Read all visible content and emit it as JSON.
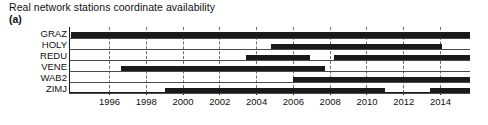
{
  "figure": {
    "title": "Real network stations coordinate availability",
    "panel_label": "(a)"
  },
  "chart_data": {
    "type": "bar",
    "title": "Real network stations coordinate availability",
    "subtitle": "(a)",
    "xlabel": "",
    "ylabel": "",
    "orientation": "horizontal",
    "grid": true,
    "grid_axis": "x",
    "legend": "none",
    "xlim": [
      1993.8,
      2015.6
    ],
    "xticks": [
      1996,
      1998,
      2000,
      2002,
      2004,
      2006,
      2008,
      2010,
      2012,
      2014
    ],
    "xtick_labels": [
      "1996",
      "1998",
      "2000",
      "2002",
      "2004",
      "2006",
      "2008",
      "2010",
      "2012",
      "2014"
    ],
    "categories": [
      "GRAZ",
      "HOLY",
      "REDU",
      "VENE",
      "WAB2",
      "ZIMJ"
    ],
    "bar_color": "#1a1a1a",
    "series": [
      {
        "name": "GRAZ",
        "label": "GRAZ",
        "intervals": [
          {
            "start": 1993.9,
            "end": 2015.6
          }
        ]
      },
      {
        "name": "HOLY",
        "label": "HOLY",
        "intervals": [
          {
            "start": 2004.8,
            "end": 2014.1
          }
        ]
      },
      {
        "name": "REDU",
        "label": "REDU",
        "intervals": [
          {
            "start": 2003.4,
            "end": 2006.9
          },
          {
            "start": 2008.2,
            "end": 2015.6
          }
        ]
      },
      {
        "name": "VENE",
        "label": "VENE",
        "intervals": [
          {
            "start": 1996.6,
            "end": 2007.7
          }
        ]
      },
      {
        "name": "WAB2",
        "label": "WAB2",
        "intervals": [
          {
            "start": 2006.0,
            "end": 2015.6
          }
        ]
      },
      {
        "name": "ZIMJ",
        "label": "ZIMJ",
        "intervals": [
          {
            "start": 1999.0,
            "end": 2011.0
          },
          {
            "start": 2013.4,
            "end": 2015.6
          }
        ]
      }
    ]
  }
}
